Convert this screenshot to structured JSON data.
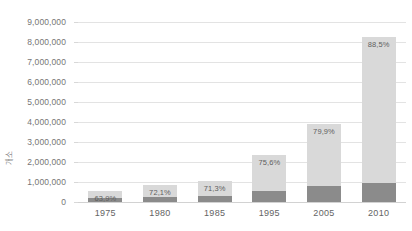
{
  "chart_data": {
    "type": "bar",
    "title": "",
    "xlabel": "",
    "ylabel": "개소",
    "ylim": [
      0,
      9000000
    ],
    "grid": true,
    "legend": "none",
    "stacked": true,
    "categories": [
      "1975",
      "1980",
      "1985",
      "1995",
      "2005",
      "2010"
    ],
    "ytick_labels": [
      "9,000,000",
      "8,000,000",
      "7,000,000",
      "6,000,000",
      "5,000,000",
      "4,000,000",
      "3,000,000",
      "2,000,000",
      "1,000,000",
      "0"
    ],
    "ytick_values": [
      9000000,
      8000000,
      7000000,
      6000000,
      5000000,
      4000000,
      3000000,
      2000000,
      1000000,
      0
    ],
    "values": [
      550000,
      850000,
      1050000,
      2350000,
      3900000,
      8250000
    ],
    "series": [
      {
        "name": "하위 구간",
        "color": "#8b8b8b",
        "values": [
          198000,
          237000,
          302000,
          574000,
          784000,
          949000
        ]
      },
      {
        "name": "상위 구간",
        "color": "#d9d9d9",
        "values": [
          352000,
          613000,
          748000,
          1776000,
          3116000,
          7301000
        ]
      }
    ],
    "data_labels": [
      "63,9%",
      "72,1%",
      "71,3%",
      "75,6%",
      "79,9%",
      "88,5%"
    ],
    "colors": {
      "segment_top": "#d9d9d9",
      "segment_bottom": "#8b8b8b",
      "gridline": "#e3e3e3",
      "axis": "#d2d2d2",
      "text": "#6e6e6e",
      "background": "#ffffff"
    }
  }
}
